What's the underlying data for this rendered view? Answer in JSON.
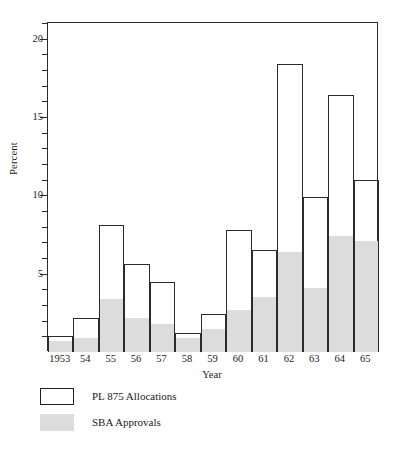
{
  "chart_data": {
    "type": "bar",
    "title": "",
    "subtitle": "",
    "xlabel": "Year",
    "ylabel": "Percent",
    "categories": [
      "1953",
      "54",
      "55",
      "56",
      "57",
      "58",
      "59",
      "60",
      "61",
      "62",
      "63",
      "64",
      "65"
    ],
    "ylim": [
      0,
      21
    ],
    "ytick_labels": [
      "5",
      "10",
      "15",
      "20"
    ],
    "ytick_values": [
      5,
      10,
      15,
      20
    ],
    "yminor_values": [
      1,
      2,
      3,
      4,
      6,
      7,
      8,
      9,
      11,
      12,
      13,
      14,
      16,
      17,
      18,
      19,
      20,
      21
    ],
    "grid": false,
    "legend_position": "below-left",
    "series": [
      {
        "name": "PL 875 Allocations",
        "style": "outline",
        "color": "#ffffff",
        "edge_color": "#2b2b2b",
        "values": [
          1.0,
          2.2,
          8.1,
          5.6,
          4.5,
          1.2,
          2.4,
          7.8,
          6.5,
          18.4,
          9.9,
          16.4,
          11.0
        ]
      },
      {
        "name": "SBA Approvals",
        "style": "filled",
        "color": "#dcdcdc",
        "edge_color": "#dcdcdc",
        "values": [
          0.7,
          0.9,
          3.4,
          2.2,
          1.8,
          0.9,
          1.5,
          2.7,
          3.5,
          6.4,
          4.1,
          7.4,
          7.1
        ]
      }
    ]
  },
  "axes": {
    "y_title": "Percent",
    "x_title": "Year"
  },
  "legend": {
    "items": [
      {
        "label": "PL 875 Allocations",
        "swatch": "outline-bar-swatch"
      },
      {
        "label": "SBA Approvals",
        "swatch": "filled-bar-swatch"
      }
    ]
  }
}
